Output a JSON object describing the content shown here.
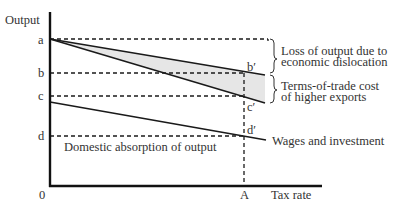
{
  "diagram": {
    "y_axis_label": "Output",
    "x_axis_label": "Tax rate",
    "origin_label": "0",
    "x_marker_label": "A",
    "levels": {
      "a": "a",
      "b": "b",
      "c": "c",
      "d": "d"
    },
    "points": {
      "b_prime": "b′",
      "c_prime": "c′",
      "d_prime": "d′"
    },
    "annotations": {
      "loss_line1": "Loss of output due to",
      "loss_line2": "economic dislocation",
      "tot_line1": "Terms-of-trade cost",
      "tot_line2": "of higher exports",
      "wages": "Wages and investment",
      "domestic": "Domestic absorption of output"
    },
    "colors": {
      "line": "#1a1a1a",
      "shade": "#e8e8e8",
      "text": "#333333"
    }
  }
}
